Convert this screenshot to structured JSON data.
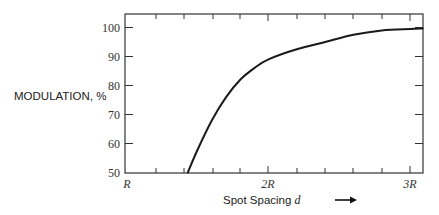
{
  "chart_data": {
    "type": "line",
    "title": "",
    "xlabel": "Spot Spacing d",
    "ylabel": "MODULATION, %",
    "xlim": [
      1.0,
      3.1
    ],
    "ylim": [
      50,
      105
    ],
    "x_tick_labels": [
      "R",
      "2R",
      "3R"
    ],
    "x_tick_values": [
      1.0,
      2.0,
      3.0
    ],
    "y_tick_labels": [
      "50",
      "60",
      "70",
      "80",
      "90",
      "100"
    ],
    "y_tick_values": [
      50,
      60,
      70,
      80,
      90,
      100
    ],
    "grid": false,
    "legend": null,
    "series": [
      {
        "name": "Modulation vs spot spacing",
        "x_units": "R",
        "x": [
          1.43,
          1.5,
          1.6,
          1.7,
          1.8,
          1.9,
          2.0,
          2.2,
          2.4,
          2.6,
          2.8,
          3.0,
          3.09
        ],
        "values": [
          50,
          58,
          68,
          76,
          82,
          86,
          89,
          92.5,
          95,
          97.5,
          99,
          99.5,
          99.7
        ]
      }
    ]
  },
  "labels": {
    "ylabel": "MODULATION, %",
    "xlabel_text": "Spot Spacing ",
    "xlabel_var": "d",
    "arrow": "⟶",
    "y_ticks": [
      "100",
      "90",
      "80",
      "70",
      "60",
      "50"
    ],
    "x_ticks": [
      "R",
      "2R",
      "3R"
    ]
  }
}
